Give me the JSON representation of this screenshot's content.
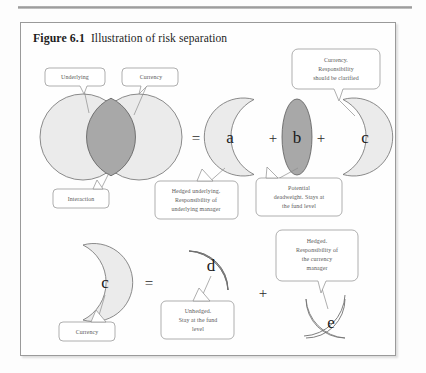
{
  "figure": {
    "number": "Figure 6.1",
    "caption": "Illustration of risk separation"
  },
  "diagram": {
    "type": "venn-risk-separation",
    "row1": {
      "shapes": [
        {
          "id": "underlying-circle",
          "label": "",
          "fill": "#ebebeb"
        },
        {
          "id": "currency-circle",
          "label": "",
          "fill": "#ebebeb"
        },
        {
          "id": "intersection-lens",
          "label": "",
          "fill": "#a8a8a8"
        },
        {
          "id": "shape-a",
          "label": "a",
          "fill": "#ebebeb"
        },
        {
          "id": "shape-b",
          "label": "b",
          "fill": "#a8a8a8"
        },
        {
          "id": "shape-c",
          "label": "c",
          "fill": "#ebebeb"
        }
      ],
      "operators": [
        "=",
        "+",
        "+"
      ]
    },
    "row2": {
      "shapes": [
        {
          "id": "shape-c2",
          "label": "c",
          "fill": "#ebebeb"
        },
        {
          "id": "shape-d",
          "label": "d",
          "fill": "#ebebeb"
        },
        {
          "id": "shape-e",
          "label": "e",
          "fill": "#ebebeb"
        }
      ],
      "operators": [
        "=",
        "+"
      ]
    }
  },
  "callouts": {
    "underlying": {
      "line1": "Underlying"
    },
    "currency_top": {
      "line1": "Currency"
    },
    "interaction": {
      "line1": "Interaction"
    },
    "currency_responsibility": {
      "line1": "Currency.",
      "line2": "Responsibility",
      "line3": "should be clarified"
    },
    "hedged_underlying": {
      "line1": "Hedged underlying.",
      "line2": "Responsibility of",
      "line3": "underlying manager"
    },
    "potential_deadweight": {
      "line1": "Potential",
      "line2": "deadweight. Stays at",
      "line3": "the fund level"
    },
    "currency_bottom": {
      "line1": "Currency"
    },
    "unhedged": {
      "line1": "Unhedged.",
      "line2": "Stay at the fund",
      "line3": "level"
    },
    "hedged_currency_manager": {
      "line1": "Hedged.",
      "line2": "Responsibility of",
      "line3": "the currency",
      "line4": "manager"
    }
  },
  "labels": {
    "a": "a",
    "b": "b",
    "c": "c",
    "c2": "c",
    "d": "d",
    "e": "e",
    "equals1": "=",
    "plus1": "+",
    "plus2": "+",
    "equals2": "=",
    "plus3": "+"
  },
  "colors": {
    "light_fill": "#ebebeb",
    "dark_fill": "#a8a8a8",
    "outline": "#6f6f6f",
    "callout_stroke": "#8c8c8c",
    "frame": "#9a9a9a"
  }
}
